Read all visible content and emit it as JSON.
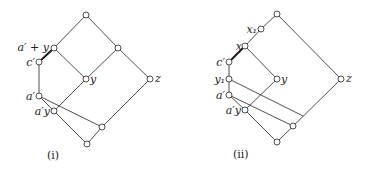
{
  "figures": [
    {
      "caption": "(i)",
      "labels": {
        "a_prime_plus_y": "a′ + y",
        "c_prime": "c′",
        "y": "y",
        "z": "z",
        "a_prime": "a′",
        "a_prime_y": "a′y"
      }
    },
    {
      "caption": "(ii)",
      "labels": {
        "x1": "x₁",
        "x": "x",
        "c_prime": "c′",
        "y1": "y₁",
        "y": "y",
        "z": "z",
        "a_prime": "a′",
        "a_prime_y": "a′y"
      }
    }
  ],
  "colors": {
    "line": "#3a3a3a",
    "node_fill": "#ffffff",
    "background": "#ffffff"
  }
}
